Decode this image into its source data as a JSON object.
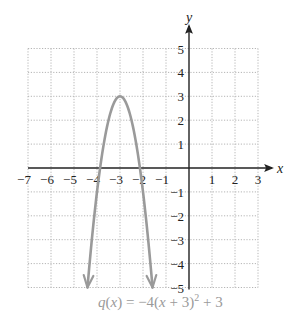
{
  "chart_data": {
    "type": "line",
    "title": "",
    "caption": "q(x) = −4(x + 3)² + 3",
    "caption_parts": {
      "fn": "q",
      "lp": "(",
      "var": "x",
      "rp": ")",
      "eq": " = −4(",
      "var2": "x",
      "rest": " + 3)",
      "sup": "2",
      "tail": " + 3"
    },
    "xlabel": "x",
    "ylabel": "y",
    "xlim": [
      -7,
      3
    ],
    "ylim": [
      -5,
      5
    ],
    "grid": true,
    "x_ticks": [
      "−7",
      "−6",
      "−5",
      "−4",
      "−3",
      "−2",
      "−1",
      "1",
      "2",
      "3"
    ],
    "x_tick_values": [
      -7,
      -6,
      -5,
      -4,
      -3,
      -2,
      -1,
      1,
      2,
      3
    ],
    "y_ticks": [
      "5",
      "4",
      "3",
      "2",
      "1",
      "−1",
      "−2",
      "−3",
      "−4",
      "−5"
    ],
    "y_tick_values": [
      5,
      4,
      3,
      2,
      1,
      -1,
      -2,
      -3,
      -4,
      -5
    ],
    "series": [
      {
        "name": "q(x) = −4(x + 3)² + 3",
        "formula": {
          "a": -4,
          "h": -3,
          "k": 3
        },
        "vertex": [
          -3,
          3
        ],
        "x_intercepts": [
          -3.866,
          -2.134
        ],
        "endpoints": [
          [
            -4.414,
            -5
          ],
          [
            -1.586,
            -5
          ]
        ],
        "color": "#9a9a9a",
        "arrows_at_ends": true
      }
    ]
  },
  "colors": {
    "curve": "#9a9a9a",
    "grid": "#b5b5b5",
    "axis": "#222222",
    "caption": "#9a9a9a"
  }
}
